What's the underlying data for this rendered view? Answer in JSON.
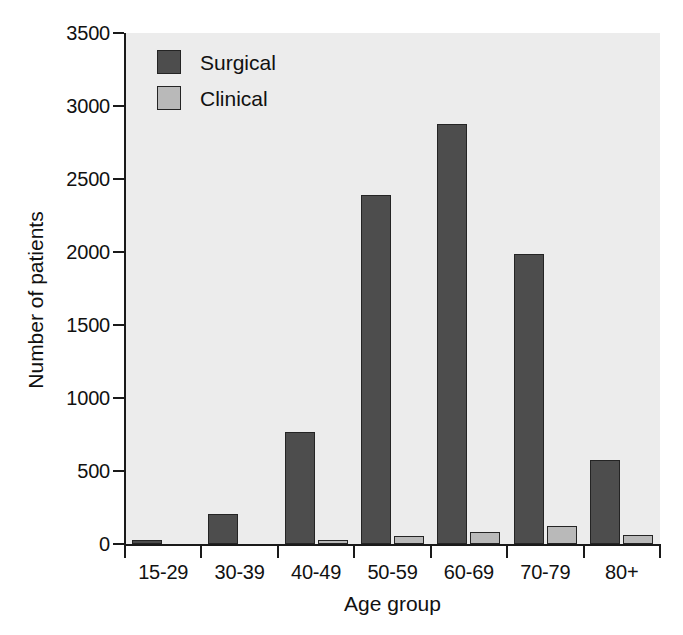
{
  "chart_data": {
    "type": "bar",
    "title": "",
    "xlabel": "Age group",
    "ylabel": "Number of patients",
    "categories": [
      "15-29",
      "30-39",
      "40-49",
      "50-59",
      "60-69",
      "70-79",
      "80+"
    ],
    "series": [
      {
        "name": "Surgical",
        "color": "#4d4d4d",
        "values": [
          30,
          205,
          770,
          2390,
          2880,
          1985,
          575
        ]
      },
      {
        "name": "Clinical",
        "color": "#b9b9b9",
        "values": [
          0,
          0,
          25,
          55,
          85,
          120,
          65
        ]
      }
    ],
    "ylim": [
      0,
      3500
    ],
    "ytick_labels": [
      "0",
      "500",
      "1000",
      "1500",
      "2000",
      "2500",
      "3000",
      "3500"
    ],
    "ytick_values": [
      0,
      500,
      1000,
      1500,
      2000,
      2500,
      3000,
      3500
    ],
    "grid": false,
    "legend_position": "top-left",
    "plot_background": "#ececec",
    "page_background": "#ffffff",
    "axis_color": "#1a1a1a"
  }
}
